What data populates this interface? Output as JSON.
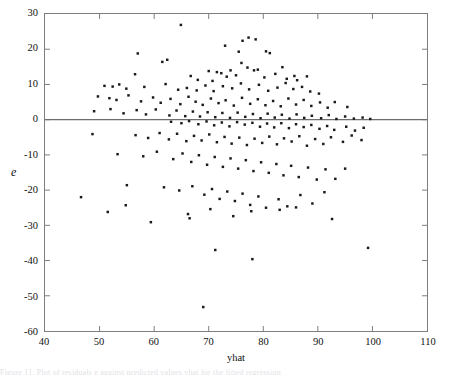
{
  "figure": {
    "kind": "scatter-residual-plot",
    "background_color": "#ffffff",
    "frame_color": "#7d7d7d",
    "point_color": "#1a1a1a",
    "refline_color": "#6e6e6e"
  },
  "axes": {
    "xlabel": "yhat",
    "ylabel": "e",
    "xticks": [
      "40",
      "50",
      "60",
      "70",
      "80",
      "90",
      "100",
      "110"
    ],
    "yticks": [
      "30",
      "20",
      "10",
      "0",
      "-10",
      "-20",
      "-30",
      "-40",
      "-50",
      "-60"
    ]
  },
  "caption": {
    "text": "Figure 11. Plot of residuals e against predicted values yhat for the fitted regression"
  },
  "chart_data": {
    "type": "scatter",
    "title": "",
    "xlabel": "yhat",
    "ylabel": "e",
    "xlim": [
      40,
      110
    ],
    "ylim": [
      -60,
      30
    ],
    "xticks": [
      40,
      50,
      60,
      70,
      80,
      90,
      100,
      110
    ],
    "yticks": [
      30,
      20,
      10,
      0,
      -10,
      -20,
      -30,
      -40,
      -50,
      -60
    ],
    "grid": false,
    "legend": null,
    "reference_lines": [
      {
        "orientation": "horizontal",
        "y": 0
      }
    ],
    "marker": {
      "shape": "dot",
      "size": 2,
      "color": "#1a1a1a"
    },
    "n_points": 232,
    "points": [
      [
        64.9,
        26.9
      ],
      [
        57.0,
        18.8
      ],
      [
        62.4,
        17.0
      ],
      [
        73.0,
        21.0
      ],
      [
        76.2,
        22.4
      ],
      [
        77.3,
        23.3
      ],
      [
        78.6,
        22.8
      ],
      [
        75.5,
        19.3
      ],
      [
        80.5,
        19.4
      ],
      [
        81.2,
        18.9
      ],
      [
        61.5,
        16.4
      ],
      [
        56.5,
        12.9
      ],
      [
        70.0,
        13.8
      ],
      [
        72.3,
        13.2
      ],
      [
        74.0,
        14.0
      ],
      [
        76.0,
        16.1
      ],
      [
        77.1,
        14.8
      ],
      [
        78.3,
        14.0
      ],
      [
        79.0,
        14.2
      ],
      [
        83.5,
        14.9
      ],
      [
        85.7,
        12.4
      ],
      [
        66.7,
        12.4
      ],
      [
        68.0,
        11.3
      ],
      [
        70.7,
        11.0
      ],
      [
        71.5,
        13.5
      ],
      [
        73.3,
        12.2
      ],
      [
        75.0,
        12.6
      ],
      [
        80.2,
        12.0
      ],
      [
        82.2,
        13.0
      ],
      [
        84.3,
        11.6
      ],
      [
        86.2,
        11.2
      ],
      [
        88.0,
        12.3
      ],
      [
        50.9,
        9.6
      ],
      [
        52.4,
        9.4
      ],
      [
        53.6,
        10.0
      ],
      [
        54.9,
        8.8
      ],
      [
        58.2,
        9.3
      ],
      [
        62.1,
        10.1
      ],
      [
        64.4,
        8.5
      ],
      [
        66.0,
        9.0
      ],
      [
        67.8,
        8.3
      ],
      [
        69.4,
        9.7
      ],
      [
        70.9,
        8.1
      ],
      [
        72.6,
        9.5
      ],
      [
        74.3,
        8.9
      ],
      [
        75.9,
        10.3
      ],
      [
        77.4,
        8.6
      ],
      [
        79.2,
        9.9
      ],
      [
        80.9,
        8.2
      ],
      [
        82.6,
        9.1
      ],
      [
        84.1,
        10.4
      ],
      [
        85.5,
        8.7
      ],
      [
        87.1,
        9.3
      ],
      [
        88.6,
        8.0
      ],
      [
        90.2,
        7.4
      ],
      [
        49.7,
        6.6
      ],
      [
        51.8,
        6.1
      ],
      [
        53.1,
        5.6
      ],
      [
        55.3,
        6.9
      ],
      [
        57.6,
        5.2
      ],
      [
        59.8,
        6.3
      ],
      [
        61.2,
        4.8
      ],
      [
        63.0,
        5.9
      ],
      [
        64.8,
        4.4
      ],
      [
        66.3,
        6.5
      ],
      [
        67.6,
        5.1
      ],
      [
        68.9,
        4.2
      ],
      [
        70.4,
        6.0
      ],
      [
        71.8,
        4.7
      ],
      [
        73.1,
        5.5
      ],
      [
        74.6,
        4.0
      ],
      [
        76.1,
        6.2
      ],
      [
        77.6,
        4.5
      ],
      [
        79.0,
        5.8
      ],
      [
        80.4,
        4.1
      ],
      [
        81.8,
        5.3
      ],
      [
        83.2,
        3.8
      ],
      [
        84.6,
        6.0
      ],
      [
        86.0,
        4.3
      ],
      [
        87.4,
        5.6
      ],
      [
        88.8,
        3.9
      ],
      [
        90.4,
        4.9
      ],
      [
        91.8,
        3.4
      ],
      [
        93.1,
        5.0
      ],
      [
        95.4,
        3.6
      ],
      [
        49.0,
        2.4
      ],
      [
        52.0,
        3.0
      ],
      [
        54.4,
        1.8
      ],
      [
        56.8,
        2.7
      ],
      [
        58.5,
        1.5
      ],
      [
        60.3,
        2.9
      ],
      [
        62.8,
        1.2
      ],
      [
        64.1,
        2.6
      ],
      [
        65.7,
        1.0
      ],
      [
        67.1,
        2.3
      ],
      [
        68.4,
        0.9
      ],
      [
        69.8,
        2.1
      ],
      [
        71.2,
        0.7
      ],
      [
        72.5,
        1.9
      ],
      [
        73.9,
        0.5
      ],
      [
        75.3,
        2.0
      ],
      [
        76.7,
        0.8
      ],
      [
        78.1,
        1.6
      ],
      [
        79.5,
        0.4
      ],
      [
        80.8,
        1.7
      ],
      [
        82.1,
        0.6
      ],
      [
        83.4,
        1.4
      ],
      [
        84.8,
        0.3
      ],
      [
        86.1,
        1.5
      ],
      [
        87.5,
        0.5
      ],
      [
        88.9,
        1.1
      ],
      [
        90.6,
        0.4
      ],
      [
        92.0,
        1.3
      ],
      [
        93.4,
        0.2
      ],
      [
        95.0,
        0.9
      ],
      [
        96.6,
        0.3
      ],
      [
        98.2,
        0.6
      ],
      [
        99.6,
        0.2
      ],
      [
        63.1,
        -0.6
      ],
      [
        65.0,
        -1.0
      ],
      [
        66.4,
        -0.4
      ],
      [
        68.1,
        -1.3
      ],
      [
        69.6,
        -0.5
      ],
      [
        71.0,
        -1.6
      ],
      [
        72.4,
        -0.8
      ],
      [
        73.8,
        -1.9
      ],
      [
        75.2,
        -0.7
      ],
      [
        76.6,
        -1.4
      ],
      [
        78.0,
        -0.9
      ],
      [
        79.4,
        -2.0
      ],
      [
        80.7,
        -1.1
      ],
      [
        82.0,
        -2.2
      ],
      [
        83.3,
        -1.0
      ],
      [
        84.7,
        -2.4
      ],
      [
        86.0,
        -1.3
      ],
      [
        87.4,
        -2.1
      ],
      [
        88.8,
        -1.5
      ],
      [
        90.3,
        -2.6
      ],
      [
        91.7,
        -1.8
      ],
      [
        93.0,
        -2.9
      ],
      [
        95.2,
        -2.0
      ],
      [
        96.8,
        -3.1
      ],
      [
        98.4,
        -2.3
      ],
      [
        48.7,
        -4.1
      ],
      [
        56.6,
        -4.4
      ],
      [
        58.9,
        -5.2
      ],
      [
        61.0,
        -3.8
      ],
      [
        62.7,
        -5.6
      ],
      [
        64.2,
        -4.0
      ],
      [
        65.9,
        -6.1
      ],
      [
        67.3,
        -4.6
      ],
      [
        68.7,
        -5.9
      ],
      [
        70.1,
        -4.2
      ],
      [
        71.5,
        -6.4
      ],
      [
        72.9,
        -4.9
      ],
      [
        74.2,
        -6.8
      ],
      [
        75.6,
        -5.1
      ],
      [
        77.0,
        -7.2
      ],
      [
        78.4,
        -5.4
      ],
      [
        79.8,
        -6.6
      ],
      [
        81.1,
        -4.8
      ],
      [
        82.5,
        -7.0
      ],
      [
        83.8,
        -5.3
      ],
      [
        85.2,
        -6.2
      ],
      [
        86.6,
        -4.7
      ],
      [
        88.0,
        -7.4
      ],
      [
        89.5,
        -5.5
      ],
      [
        91.0,
        -6.9
      ],
      [
        92.4,
        -5.0
      ],
      [
        94.6,
        -6.3
      ],
      [
        96.2,
        -4.5
      ],
      [
        98.0,
        -5.8
      ],
      [
        53.3,
        -9.8
      ],
      [
        58.0,
        -10.4
      ],
      [
        60.5,
        -9.1
      ],
      [
        63.5,
        -11.2
      ],
      [
        65.2,
        -9.6
      ],
      [
        66.8,
        -12.0
      ],
      [
        68.2,
        -10.1
      ],
      [
        69.7,
        -12.8
      ],
      [
        71.1,
        -10.6
      ],
      [
        72.6,
        -13.4
      ],
      [
        74.0,
        -11.0
      ],
      [
        75.4,
        -13.9
      ],
      [
        76.8,
        -11.5
      ],
      [
        78.2,
        -14.6
      ],
      [
        79.6,
        -12.1
      ],
      [
        81.0,
        -15.1
      ],
      [
        82.4,
        -12.6
      ],
      [
        83.7,
        -15.8
      ],
      [
        85.1,
        -13.1
      ],
      [
        86.5,
        -16.3
      ],
      [
        88.2,
        -13.6
      ],
      [
        89.8,
        -17.0
      ],
      [
        91.4,
        -14.1
      ],
      [
        93.2,
        -16.8
      ],
      [
        95.0,
        -13.9
      ],
      [
        55.0,
        -18.6
      ],
      [
        61.8,
        -19.2
      ],
      [
        64.6,
        -20.1
      ],
      [
        67.0,
        -18.9
      ],
      [
        69.2,
        -21.3
      ],
      [
        70.6,
        -19.7
      ],
      [
        72.0,
        -22.5
      ],
      [
        73.4,
        -20.4
      ],
      [
        74.8,
        -23.1
      ],
      [
        76.2,
        -21.0
      ],
      [
        77.6,
        -24.2
      ],
      [
        79.1,
        -21.8
      ],
      [
        80.5,
        -25.0
      ],
      [
        82.8,
        -22.6
      ],
      [
        84.4,
        -24.6
      ],
      [
        86.8,
        -21.4
      ],
      [
        89.0,
        -23.8
      ],
      [
        91.2,
        -20.6
      ],
      [
        46.6,
        -22.0
      ],
      [
        51.5,
        -26.2
      ],
      [
        54.8,
        -24.3
      ],
      [
        59.4,
        -29.1
      ],
      [
        66.2,
        -26.8
      ],
      [
        66.5,
        -28.0
      ],
      [
        70.3,
        -25.4
      ],
      [
        74.5,
        -27.4
      ],
      [
        77.8,
        -26.0
      ],
      [
        83.0,
        -25.6
      ],
      [
        86.0,
        -24.9
      ],
      [
        92.6,
        -28.2
      ],
      [
        71.2,
        -37.0
      ],
      [
        78.0,
        -39.6
      ],
      [
        99.2,
        -36.4
      ],
      [
        69.0,
        -53.2
      ]
    ]
  }
}
